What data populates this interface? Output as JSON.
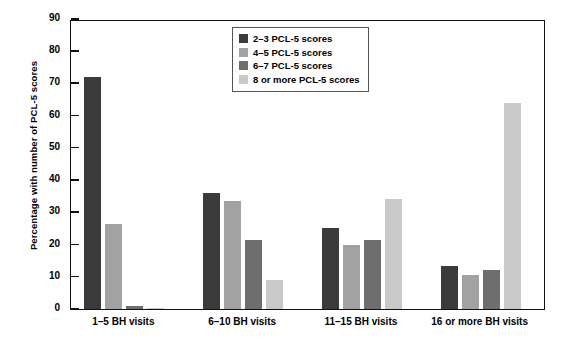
{
  "chart_data": {
    "type": "bar",
    "title": "",
    "subtitle": "",
    "xlabel": "",
    "ylabel": "Percentage with number of PCL-5 scores",
    "categories": [
      "1–5 BH visits",
      "6–10 BH visits",
      "11–15 BH visits",
      "16 or more BH visits"
    ],
    "series": [
      {
        "name": "2–3 PCL-5 scores",
        "color": "#3b3b3b",
        "values": [
          72,
          36,
          25,
          13.5
        ]
      },
      {
        "name": "4–5 PCL-5 scores",
        "color": "#a2a2a2",
        "values": [
          26.5,
          33.5,
          20,
          10.5
        ]
      },
      {
        "name": "6–7 PCL-5 scores",
        "color": "#6e6e6e",
        "values": [
          1,
          21.5,
          21.5,
          12
        ]
      },
      {
        "name": "8 or more PCL-5 scores",
        "color": "#c9c9c9",
        "values": [
          0.3,
          9,
          34,
          64
        ]
      }
    ],
    "ylim": [
      0,
      90
    ],
    "yticks": [
      0,
      10,
      20,
      30,
      40,
      50,
      60,
      70,
      80,
      90
    ],
    "grid": false,
    "legend_position": "top-center"
  },
  "legend": {
    "items": [
      {
        "label": "2–3 PCL-5 scores"
      },
      {
        "label": "4–5 PCL-5 scores"
      },
      {
        "label": "6–7 PCL-5 scores"
      },
      {
        "label": "8 or more PCL-5 scores"
      }
    ]
  },
  "axis": {
    "y_title": "Percentage with number of PCL-5 scores",
    "y_tick_labels": [
      "0",
      "10",
      "20",
      "30",
      "40",
      "50",
      "60",
      "70",
      "80",
      "90"
    ],
    "x_tick_labels": [
      "1–5 BH visits",
      "6–10 BH visits",
      "11–15 BH visits",
      "16 or more BH visits"
    ]
  }
}
